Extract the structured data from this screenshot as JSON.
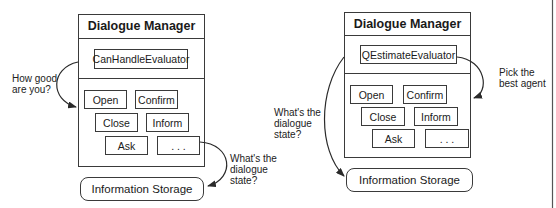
{
  "diagrams": [
    {
      "title": "Dialogue Manager",
      "evaluator": "CanHandleEvaluator",
      "agents": [
        "Open",
        "Confirm",
        "Close",
        "Inform",
        "Ask",
        ". . ."
      ],
      "storage": "Information Storage",
      "annotations": {
        "left": "How good\nare you?",
        "right": "What's the\ndialogue\nstate?"
      }
    },
    {
      "title": "Dialogue Manager",
      "evaluator": "QEstimateEvaluator",
      "agents": [
        "Open",
        "Confirm",
        "Close",
        "Inform",
        "Ask",
        ". . ."
      ],
      "storage": "Information Storage",
      "annotations": {
        "left": "What's the\ndialogue\nstate?",
        "right": "Pick the\nbest agent"
      }
    }
  ],
  "colors": {
    "line": "#3a3a3a",
    "background": "#ffffff"
  }
}
